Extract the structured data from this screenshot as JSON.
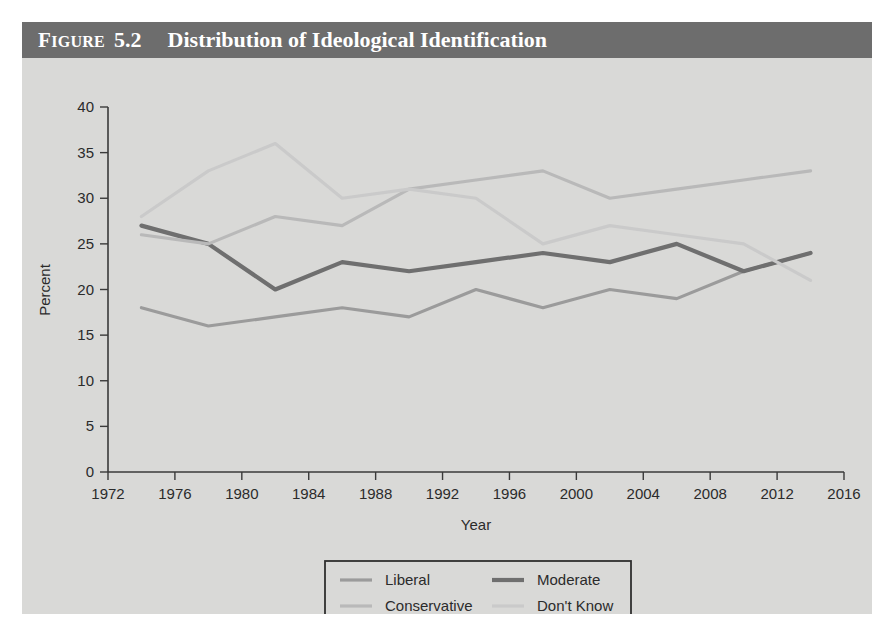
{
  "figure": {
    "label_prefix": "F",
    "label_rest": "IGURE",
    "number": "5.2",
    "title": "Distribution of Ideological Identification"
  },
  "colors": {
    "panel_background": "#d9d9d7",
    "title_bar": "#6d6d6d",
    "title_text": "#ffffff",
    "axis": "#3a3a3a",
    "liberal": "#9b9b9b",
    "moderate": "#6f6f6f",
    "conservative": "#b9b9b9",
    "dont_know": "#cacaca"
  },
  "chart_data": {
    "type": "line",
    "title": "Distribution of Ideological Identification",
    "xlabel": "Year",
    "ylabel": "Percent",
    "xlim": [
      1972,
      2016
    ],
    "ylim": [
      0,
      40
    ],
    "xticks": [
      1972,
      1976,
      1980,
      1984,
      1988,
      1992,
      1996,
      2000,
      2004,
      2008,
      2012,
      2016
    ],
    "yticks": [
      0,
      5,
      10,
      15,
      20,
      25,
      30,
      35,
      40
    ],
    "grid": false,
    "legend_position": "bottom",
    "x": [
      1974,
      1978,
      1982,
      1986,
      1990,
      1994,
      1998,
      2002,
      2006,
      2010,
      2014
    ],
    "series": [
      {
        "name": "Liberal",
        "color": "#9b9b9b",
        "width": 3.2,
        "values": [
          18,
          16,
          17,
          18,
          17,
          20,
          18,
          20,
          19,
          22,
          24
        ]
      },
      {
        "name": "Moderate",
        "color": "#6f6f6f",
        "width": 4.2,
        "values": [
          27,
          25,
          20,
          23,
          22,
          23,
          24,
          23,
          25,
          22,
          24
        ]
      },
      {
        "name": "Conservative",
        "color": "#b9b9b9",
        "width": 3.2,
        "values": [
          26,
          25,
          28,
          27,
          31,
          32,
          33,
          30,
          31,
          32,
          33
        ]
      },
      {
        "name": "Don't Know",
        "color": "#cacaca",
        "width": 3.2,
        "values": [
          28,
          33,
          36,
          30,
          31,
          30,
          25,
          27,
          26,
          25,
          21
        ]
      }
    ]
  },
  "legend": {
    "entries": [
      {
        "label": "Liberal"
      },
      {
        "label": "Moderate"
      },
      {
        "label": "Conservative"
      },
      {
        "label": "Don't Know"
      }
    ]
  },
  "axis": {
    "x_title": "Year",
    "y_title": "Percent"
  }
}
